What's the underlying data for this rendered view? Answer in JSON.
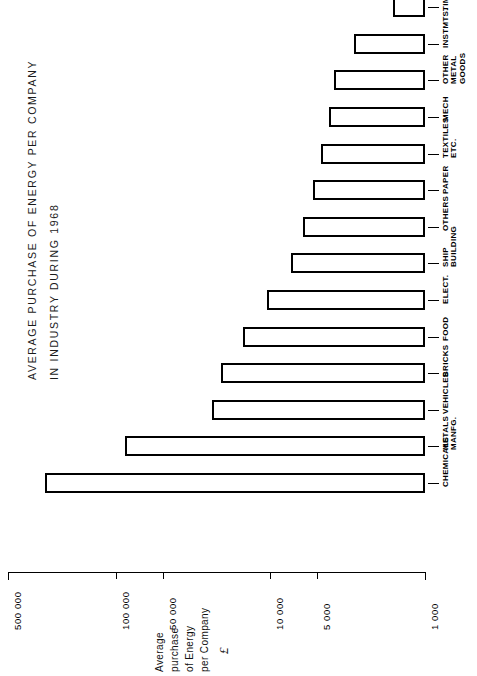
{
  "title": {
    "line1": "AVERAGE PURCHASE OF ENERGY PER COMPANY",
    "line2": "IN INDUSTRY DURING 1968"
  },
  "axis": {
    "caption_line1": "Average",
    "caption_line2": "purchase",
    "caption_line3": "of Energy",
    "caption_line4": "per Company",
    "unit_symbol": "£",
    "tick_labels": [
      "500 000",
      "100 000",
      "50 000",
      "10 000",
      "5 000",
      "1 000"
    ]
  },
  "chart_data": {
    "type": "bar",
    "orientation": "horizontal-rotated-90",
    "title": "AVERAGE PURCHASE OF ENERGY PER COMPANY IN INDUSTRY DURING 1968",
    "xlabel": "Average purchase of Energy per Company £",
    "ylabel": "",
    "scale": "log",
    "baseline": 1000,
    "xlim": [
      1000,
      500000
    ],
    "grid": false,
    "legend": false,
    "tick_values": [
      500000,
      100000,
      50000,
      10000,
      5000,
      1000
    ],
    "tick_text": [
      "500 000",
      "100 000",
      "50 000",
      "10 000",
      "5 000",
      "1 000"
    ],
    "categories": [
      "CHEMICALS",
      "METALS MANFG.",
      "VEHICLES",
      "BRICKS",
      "FOOD",
      "ELECT.",
      "SHIP BUILDING",
      "OTHERS",
      "PAPER",
      "TEXTILES ETC.",
      "MECH",
      "OTHER METAL GOODS",
      "INSTMTS.",
      "TIMBER"
    ],
    "values": [
      290000,
      88000,
      24000,
      21000,
      15000,
      10500,
      7400,
      6200,
      5300,
      4700,
      4200,
      3900,
      2900,
      1600
    ]
  },
  "bars": [
    {
      "label": "CHEMICALS",
      "label_lines": [
        "CHEMICALS"
      ],
      "value": 290000
    },
    {
      "label": "METALS MANFG.",
      "label_lines": [
        "METALS",
        "MANFG."
      ],
      "value": 88000
    },
    {
      "label": "VEHICLES",
      "label_lines": [
        "VEHICLES"
      ],
      "value": 24000
    },
    {
      "label": "BRICKS",
      "label_lines": [
        "BRICKS"
      ],
      "value": 21000
    },
    {
      "label": "FOOD",
      "label_lines": [
        "FOOD"
      ],
      "value": 15000
    },
    {
      "label": "ELECT.",
      "label_lines": [
        "ELECT."
      ],
      "value": 10500
    },
    {
      "label": "SHIP BUILDING",
      "label_lines": [
        "SHIP",
        "BUILDING"
      ],
      "value": 7400
    },
    {
      "label": "OTHERS",
      "label_lines": [
        "OTHERS"
      ],
      "value": 6200
    },
    {
      "label": "PAPER",
      "label_lines": [
        "PAPER"
      ],
      "value": 5300
    },
    {
      "label": "TEXTILES ETC.",
      "label_lines": [
        "TEXTILES",
        "ETC."
      ],
      "value": 4700
    },
    {
      "label": "MECH",
      "label_lines": [
        "MECH"
      ],
      "value": 4200
    },
    {
      "label": "OTHER METAL GOODS",
      "label_lines": [
        "OTHER",
        "METAL",
        "GOODS"
      ],
      "value": 3900
    },
    {
      "label": "INSTMTS.",
      "label_lines": [
        "INSTMTS."
      ],
      "value": 2900
    },
    {
      "label": "TIMBER",
      "label_lines": [
        "TIMBER"
      ],
      "value": 1600
    }
  ]
}
